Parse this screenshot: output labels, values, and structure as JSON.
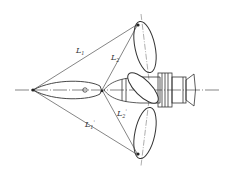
{
  "diagram": {
    "type": "optical-geometry-schematic",
    "labels": {
      "L1": "L",
      "L1_sub": "1",
      "L2": "L",
      "L2_sub": "2",
      "L1p": "L",
      "L1p_sub": "1",
      "L1p_prime": "'",
      "L2p": "L",
      "L2p_sub": "2",
      "L2p_prime": "'"
    },
    "colors": {
      "line": "#333333",
      "background": "#ffffff"
    },
    "elements": [
      "optical-axis",
      "left-apex-point",
      "center-point",
      "upper-ellipse-lobe",
      "lower-ellipse-lobe",
      "central-lens-lobe",
      "tilted-mirror-ellipse",
      "eyepiece-device"
    ]
  }
}
